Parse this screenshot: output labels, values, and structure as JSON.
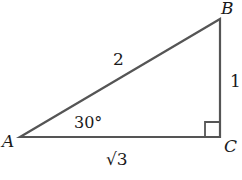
{
  "diagram": {
    "type": "right-triangle",
    "vertices": {
      "A": {
        "label": "A"
      },
      "B": {
        "label": "B"
      },
      "C": {
        "label": "C"
      }
    },
    "sides": {
      "AB": {
        "label": "2"
      },
      "BC": {
        "label": "1"
      },
      "AC": {
        "label": "√3"
      }
    },
    "angle_A": {
      "label": "30°"
    },
    "right_angle_at": "C",
    "line_color": "#555555"
  }
}
